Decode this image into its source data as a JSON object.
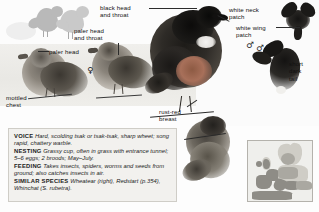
{
  "page": {
    "species_common_name": "Stonechat",
    "background_color": "#fdfdfd",
    "panel_color": "#f2f1ee",
    "panel_border_color": "#cfcdc7"
  },
  "callouts": {
    "black_head_and_throat": "black head\nand throat",
    "paler_head_and_throat": "paler head\nand throat",
    "paler_head": "paler head",
    "mottled_chest": "mottled\nchest",
    "white_neck_patch": "white neck\npatch",
    "white_wing_patch": "white wing\npatch",
    "short_dark_tail": "short\ndark\ntail",
    "rust_red_breast": "rust-red\nbreast"
  },
  "symbols": {
    "female": "♀",
    "male": "♂",
    "male_flight_upper": "♂",
    "male_flight_lower": "♂"
  },
  "info_panel": {
    "entries": [
      {
        "heading": "VOICE",
        "text": "Hard, scolding tsak or tsak-tsak, sharp wheet; song rapid, chattery warble."
      },
      {
        "heading": "NESTING",
        "text": "Grassy cup, often in grass with entrance tunnel; 5–6 eggs; 2 broods; May–July."
      },
      {
        "heading": "FEEDING",
        "text": "Takes insects, spiders, worms and seeds from ground; also catches insects in air."
      },
      {
        "heading": "SIMILAR SPECIES",
        "text": "Wheatear (right), Redstart (p.354), Whinchat (S. rubetra)."
      }
    ]
  },
  "map": {
    "name": "distribution-map-europe",
    "region": "Europe",
    "land_color": "#cfcdc6",
    "range_color": "#8e8c86",
    "sea_color": "#efefec"
  },
  "illustrations": {
    "sketch_pair": "grey-silhouette-sketches",
    "female_perched_left": "female-stonechat-perched",
    "female_perched_center": "female-stonechat-perched",
    "male_perched_main": "male-stonechat-perched-large",
    "male_flight_upper": "male-stonechat-in-flight",
    "male_flight_lower": "male-stonechat-in-flight",
    "wheatear_comparison": "wheatear-perched"
  }
}
